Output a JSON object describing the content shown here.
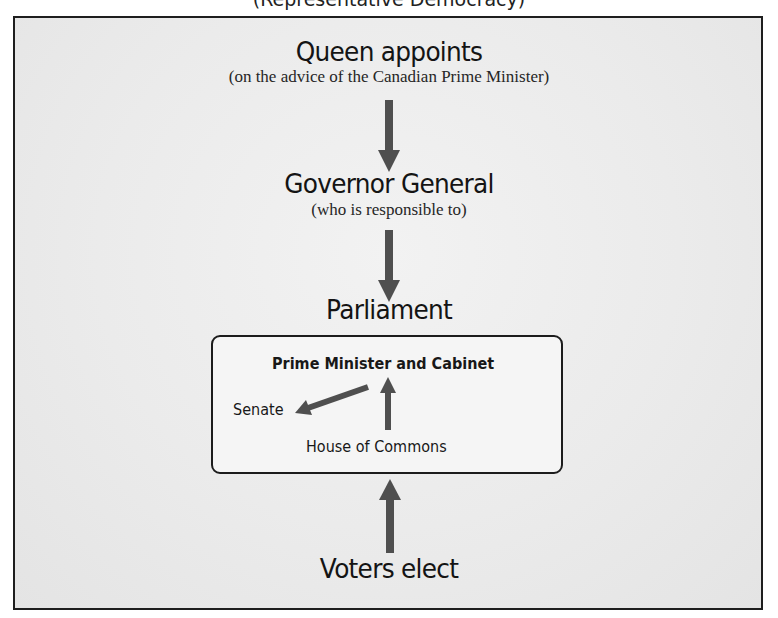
{
  "diagram": {
    "top_caption_partial": "(Representative Democracy)",
    "queen": {
      "heading": "Queen appoints",
      "note": "(on the advice of the Canadian Prime Minister)"
    },
    "governor": {
      "heading": "Governor General",
      "note": "(who is responsible to)"
    },
    "parliament": {
      "heading": "Parliament",
      "box": {
        "top": "Prime Minister and Cabinet",
        "left": "Senate",
        "bottom": "House of Commons"
      }
    },
    "voters": {
      "heading": "Voters elect"
    },
    "arrows": [
      {
        "from": "Queen appoints",
        "to": "Governor General",
        "direction": "down"
      },
      {
        "from": "Governor General",
        "to": "Parliament",
        "direction": "down"
      },
      {
        "from": "House of Commons",
        "to": "Prime Minister and Cabinet",
        "direction": "up"
      },
      {
        "from": "Prime Minister and Cabinet",
        "to": "Senate",
        "direction": "down-left"
      },
      {
        "from": "Voters elect",
        "to": "Parliament",
        "direction": "up"
      }
    ],
    "colors": {
      "arrow": "#4f4f4f",
      "frame_border": "#1e1e1e",
      "frame_bg": "#ebebeb",
      "inner_bg": "#f5f5f5",
      "text": "#141414"
    }
  }
}
